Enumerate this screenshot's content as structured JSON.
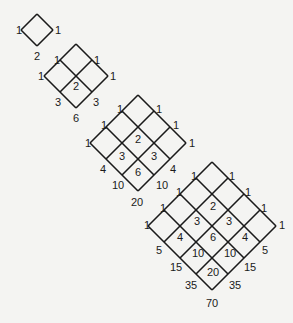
{
  "figure": {
    "line_color": "#1a1a1a",
    "background_color": "#f4f4f2",
    "cell_half_diagonal": 16,
    "diamonds": [
      {
        "size": 1,
        "top": [
          37,
          14
        ],
        "labels": [
          {
            "text": "1",
            "x": 16,
            "y": 34
          },
          {
            "text": "1",
            "x": 55,
            "y": 34
          },
          {
            "text": "2",
            "x": 34,
            "y": 60
          }
        ]
      },
      {
        "size": 2,
        "top": [
          76,
          44
        ],
        "labels": [
          {
            "text": "1",
            "x": 54,
            "y": 64
          },
          {
            "text": "1",
            "x": 94,
            "y": 64
          },
          {
            "text": "1",
            "x": 38,
            "y": 80
          },
          {
            "text": "1",
            "x": 110,
            "y": 80
          },
          {
            "text": "2",
            "x": 73,
            "y": 90
          },
          {
            "text": "3",
            "x": 55,
            "y": 106
          },
          {
            "text": "3",
            "x": 93,
            "y": 106
          },
          {
            "text": "6",
            "x": 73,
            "y": 122
          }
        ]
      },
      {
        "size": 3,
        "top": [
          138,
          95
        ],
        "labels": [
          {
            "text": "1",
            "x": 117,
            "y": 113
          },
          {
            "text": "1",
            "x": 156,
            "y": 113
          },
          {
            "text": "1",
            "x": 101,
            "y": 129
          },
          {
            "text": "1",
            "x": 173,
            "y": 129
          },
          {
            "text": "1",
            "x": 85,
            "y": 147
          },
          {
            "text": "2",
            "x": 135,
            "y": 143
          },
          {
            "text": "1",
            "x": 189,
            "y": 147
          },
          {
            "text": "3",
            "x": 119,
            "y": 160
          },
          {
            "text": "3",
            "x": 151,
            "y": 160
          },
          {
            "text": "4",
            "x": 100,
            "y": 173
          },
          {
            "text": "6",
            "x": 135,
            "y": 176
          },
          {
            "text": "4",
            "x": 170,
            "y": 173
          },
          {
            "text": "10",
            "x": 112,
            "y": 189
          },
          {
            "text": "10",
            "x": 156,
            "y": 189
          },
          {
            "text": "20",
            "x": 131,
            "y": 206
          }
        ]
      },
      {
        "size": 4,
        "top": [
          212,
          162
        ],
        "labels": [
          {
            "text": "1",
            "x": 191,
            "y": 180
          },
          {
            "text": "1",
            "x": 229,
            "y": 180
          },
          {
            "text": "1",
            "x": 176,
            "y": 196
          },
          {
            "text": "1",
            "x": 245,
            "y": 196
          },
          {
            "text": "1",
            "x": 160,
            "y": 212
          },
          {
            "text": "2",
            "x": 210,
            "y": 210
          },
          {
            "text": "1",
            "x": 261,
            "y": 212
          },
          {
            "text": "1",
            "x": 144,
            "y": 229
          },
          {
            "text": "3",
            "x": 194,
            "y": 225
          },
          {
            "text": "3",
            "x": 226,
            "y": 225
          },
          {
            "text": "1",
            "x": 279,
            "y": 229
          },
          {
            "text": "4",
            "x": 177,
            "y": 241
          },
          {
            "text": "6",
            "x": 210,
            "y": 241
          },
          {
            "text": "4",
            "x": 242,
            "y": 241
          },
          {
            "text": "5",
            "x": 156,
            "y": 254
          },
          {
            "text": "10",
            "x": 192,
            "y": 257
          },
          {
            "text": "10",
            "x": 224,
            "y": 257
          },
          {
            "text": "5",
            "x": 262,
            "y": 254
          },
          {
            "text": "15",
            "x": 170,
            "y": 271
          },
          {
            "text": "20",
            "x": 207,
            "y": 276
          },
          {
            "text": "15",
            "x": 244,
            "y": 271
          },
          {
            "text": "35",
            "x": 185,
            "y": 289
          },
          {
            "text": "35",
            "x": 229,
            "y": 289
          },
          {
            "text": "70",
            "x": 206,
            "y": 307
          }
        ]
      }
    ]
  }
}
